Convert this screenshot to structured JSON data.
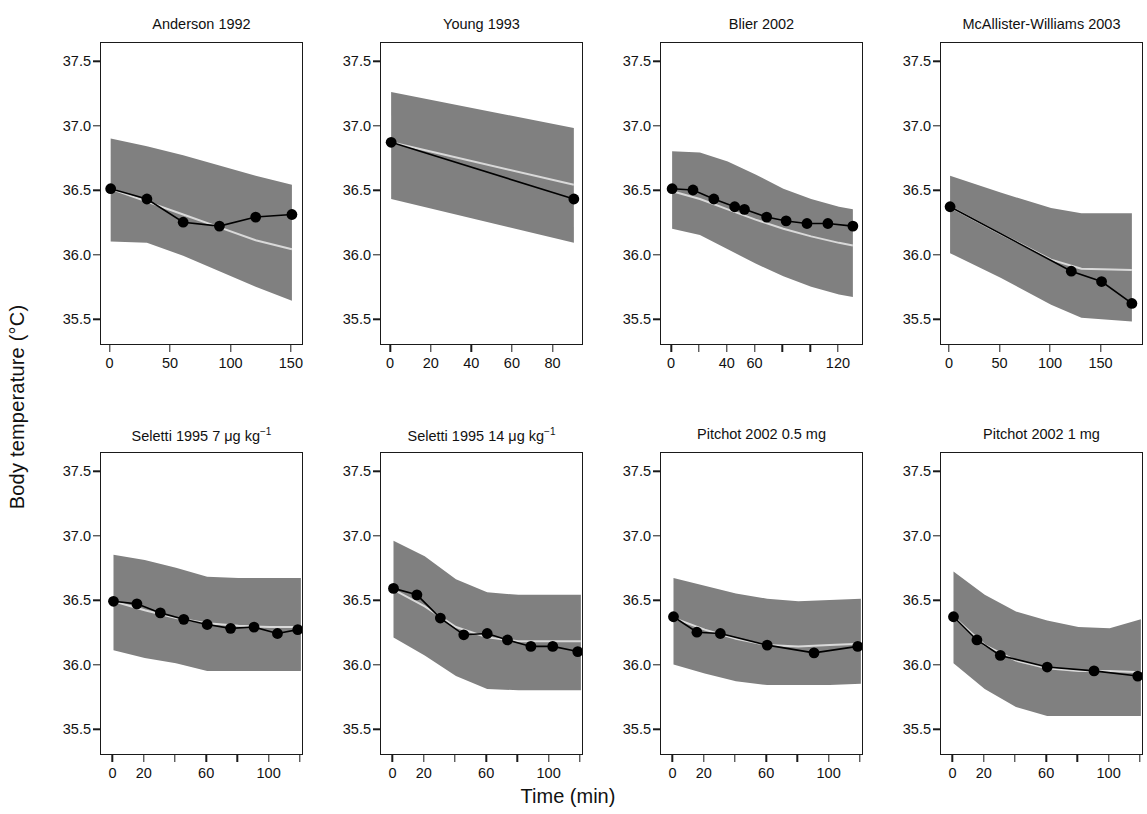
{
  "figure": {
    "ylabel": "Body temperature (°C)",
    "xlabel": "Time (min)",
    "band_color": "#808080",
    "mean_line_color": "#d9d9d9",
    "observed_color": "#000000"
  },
  "chart_data": {
    "type": "line",
    "title": "",
    "xlabel": "Time (min)",
    "ylabel": "Body temperature (°C)",
    "ylim": [
      35.3,
      37.65
    ],
    "yticks": [
      35.5,
      36.0,
      36.5,
      37.0,
      37.5
    ],
    "ytick_labels": [
      "35.5",
      "36.0",
      "36.5",
      "37.0",
      "37.5"
    ],
    "grid": false,
    "legend": "none",
    "layout": {
      "rows": 2,
      "cols": 4
    },
    "series_description": {
      "observed": "Observed mean body temperature (filled black circles joined by black line)",
      "band": "Grey shaded 95% prediction interval",
      "model": "Light grey model-predicted mean line"
    },
    "panels": [
      {
        "title": "Anderson 1992",
        "row": 0,
        "col": 0,
        "xlim": [
          -8,
          160
        ],
        "xticks": [
          0,
          50,
          100,
          150
        ],
        "xtick_labels": [
          "0",
          "50",
          "100",
          "150"
        ],
        "xtick_minor": [],
        "observed": {
          "x": [
            0,
            30,
            60,
            90,
            120,
            150
          ],
          "y": [
            36.52,
            36.44,
            36.26,
            36.23,
            36.3,
            36.32
          ]
        },
        "model_line": {
          "x": [
            0,
            30,
            60,
            90,
            120,
            150
          ],
          "y": [
            36.52,
            36.42,
            36.32,
            36.22,
            36.12,
            36.05
          ]
        },
        "band_upper": {
          "x": [
            0,
            30,
            60,
            90,
            120,
            150
          ],
          "y": [
            36.91,
            36.85,
            36.78,
            36.7,
            36.62,
            36.55
          ]
        },
        "band_lower": {
          "x": [
            0,
            30,
            60,
            90,
            120,
            150
          ],
          "y": [
            36.11,
            36.1,
            36.0,
            35.88,
            35.76,
            35.65
          ]
        }
      },
      {
        "title": "Young 1993",
        "row": 0,
        "col": 1,
        "xlim": [
          -5,
          95
        ],
        "xticks": [
          0,
          20,
          40,
          60,
          80
        ],
        "xtick_labels": [
          "0",
          "20",
          "40",
          "60",
          "80"
        ],
        "xtick_minor": [],
        "observed": {
          "x": [
            0,
            90
          ],
          "y": [
            36.88,
            36.44
          ]
        },
        "model_line": {
          "x": [
            0,
            90
          ],
          "y": [
            36.88,
            36.55
          ]
        },
        "band_upper": {
          "x": [
            0,
            90
          ],
          "y": [
            37.27,
            36.99
          ]
        },
        "band_lower": {
          "x": [
            0,
            90
          ],
          "y": [
            36.44,
            36.1
          ]
        }
      },
      {
        "title": "Blier 2002",
        "row": 0,
        "col": 2,
        "xlim": [
          -8,
          138
        ],
        "xticks": [
          0,
          40,
          60,
          120
        ],
        "xtick_labels": [
          "0",
          "40",
          "60",
          "120"
        ],
        "xtick_minor": [
          20,
          80,
          100
        ],
        "observed": {
          "x": [
            0,
            15,
            30,
            45,
            52,
            68,
            82,
            97,
            112,
            130
          ],
          "y": [
            36.52,
            36.51,
            36.44,
            36.38,
            36.36,
            36.3,
            36.27,
            36.25,
            36.25,
            36.23
          ]
        },
        "model_line": {
          "x": [
            0,
            20,
            40,
            60,
            80,
            100,
            120,
            130
          ],
          "y": [
            36.5,
            36.44,
            36.36,
            36.28,
            36.21,
            36.15,
            36.1,
            36.08
          ]
        },
        "band_upper": {
          "x": [
            0,
            20,
            40,
            60,
            80,
            100,
            120,
            130
          ],
          "y": [
            36.81,
            36.8,
            36.73,
            36.63,
            36.52,
            36.44,
            36.38,
            36.36
          ]
        },
        "band_lower": {
          "x": [
            0,
            20,
            40,
            60,
            80,
            100,
            120,
            130
          ],
          "y": [
            36.21,
            36.16,
            36.05,
            35.94,
            35.84,
            35.76,
            35.7,
            35.68
          ]
        }
      },
      {
        "title": "McAllister-Williams 2003",
        "row": 0,
        "col": 3,
        "xlim": [
          -9,
          192
        ],
        "xticks": [
          0,
          50,
          100,
          150
        ],
        "xtick_labels": [
          "0",
          "50",
          "100",
          "150"
        ],
        "xtick_minor": [],
        "observed": {
          "x": [
            0,
            120,
            150,
            180
          ],
          "y": [
            36.38,
            35.88,
            35.8,
            35.63
          ]
        },
        "model_line": {
          "x": [
            0,
            50,
            100,
            130,
            180
          ],
          "y": [
            36.38,
            36.17,
            35.97,
            35.9,
            35.89
          ]
        },
        "band_upper": {
          "x": [
            0,
            50,
            100,
            130,
            180
          ],
          "y": [
            36.62,
            36.49,
            36.37,
            36.33,
            36.33
          ]
        },
        "band_lower": {
          "x": [
            0,
            50,
            100,
            130,
            180
          ],
          "y": [
            36.02,
            35.83,
            35.62,
            35.52,
            35.49
          ]
        }
      },
      {
        "title": "Seletti 1995  7 μg kg",
        "title_sup": "−1",
        "row": 1,
        "col": 0,
        "xlim": [
          -8,
          122
        ],
        "xticks": [
          0,
          20,
          60,
          100
        ],
        "xtick_labels": [
          "0",
          "20",
          "60",
          "100"
        ],
        "xtick_minor": [
          40,
          80,
          120
        ],
        "observed": {
          "x": [
            0,
            15,
            30,
            45,
            60,
            75,
            90,
            105,
            118
          ],
          "y": [
            36.5,
            36.48,
            36.41,
            36.36,
            36.32,
            36.29,
            36.3,
            36.25,
            36.28
          ]
        },
        "model_line": {
          "x": [
            0,
            20,
            40,
            60,
            80,
            100,
            120
          ],
          "y": [
            36.5,
            36.43,
            36.37,
            36.33,
            36.31,
            36.3,
            36.3
          ]
        },
        "band_upper": {
          "x": [
            0,
            20,
            40,
            60,
            80,
            100,
            120
          ],
          "y": [
            36.86,
            36.82,
            36.76,
            36.69,
            36.68,
            36.68,
            36.68
          ]
        },
        "band_lower": {
          "x": [
            0,
            20,
            40,
            60,
            80,
            100,
            120
          ],
          "y": [
            36.12,
            36.06,
            36.02,
            35.96,
            35.96,
            35.96,
            35.96
          ]
        }
      },
      {
        "title": "Seletti 1995  14 μg kg",
        "title_sup": "−1",
        "row": 1,
        "col": 1,
        "xlim": [
          -8,
          122
        ],
        "xticks": [
          0,
          20,
          60,
          100
        ],
        "xtick_labels": [
          "0",
          "20",
          "60",
          "100"
        ],
        "xtick_minor": [
          40,
          80,
          120
        ],
        "observed": {
          "x": [
            0,
            15,
            30,
            45,
            60,
            73,
            88,
            102,
            118
          ],
          "y": [
            36.6,
            36.55,
            36.37,
            36.24,
            36.25,
            36.2,
            36.15,
            36.15,
            36.11
          ]
        },
        "model_line": {
          "x": [
            0,
            20,
            40,
            60,
            80,
            100,
            120
          ],
          "y": [
            36.59,
            36.46,
            36.3,
            36.22,
            36.19,
            36.19,
            36.19
          ]
        },
        "band_upper": {
          "x": [
            0,
            20,
            40,
            60,
            80,
            100,
            120
          ],
          "y": [
            36.97,
            36.85,
            36.67,
            36.57,
            36.55,
            36.55,
            36.55
          ]
        },
        "band_lower": {
          "x": [
            0,
            20,
            40,
            60,
            80,
            100,
            120
          ],
          "y": [
            36.22,
            36.08,
            35.92,
            35.82,
            35.81,
            35.81,
            35.81
          ]
        }
      },
      {
        "title": "Pitchot 2002  0.5 mg",
        "row": 1,
        "col": 2,
        "xlim": [
          -8,
          122
        ],
        "xticks": [
          0,
          20,
          60,
          100
        ],
        "xtick_labels": [
          "0",
          "20",
          "60",
          "100"
        ],
        "xtick_minor": [
          40,
          80,
          120
        ],
        "observed": {
          "x": [
            0,
            15,
            30,
            60,
            90,
            118
          ],
          "y": [
            36.38,
            36.26,
            36.25,
            36.16,
            36.1,
            36.15
          ]
        },
        "model_line": {
          "x": [
            0,
            20,
            40,
            60,
            80,
            100,
            120
          ],
          "y": [
            36.37,
            36.28,
            36.21,
            36.16,
            36.15,
            36.16,
            36.17
          ]
        },
        "band_upper": {
          "x": [
            0,
            20,
            40,
            60,
            80,
            100,
            120
          ],
          "y": [
            36.68,
            36.62,
            36.56,
            36.52,
            36.5,
            36.51,
            36.52
          ]
        },
        "band_lower": {
          "x": [
            0,
            20,
            40,
            60,
            80,
            100,
            120
          ],
          "y": [
            36.01,
            35.94,
            35.88,
            35.85,
            35.85,
            35.85,
            35.86
          ]
        }
      },
      {
        "title": "Pitchot 2002  1 mg",
        "row": 1,
        "col": 3,
        "xlim": [
          -8,
          122
        ],
        "xticks": [
          0,
          20,
          60,
          100
        ],
        "xtick_labels": [
          "0",
          "20",
          "60",
          "100"
        ],
        "xtick_minor": [
          40,
          80,
          120
        ],
        "observed": {
          "x": [
            0,
            15,
            30,
            60,
            90,
            118
          ],
          "y": [
            36.38,
            36.2,
            36.08,
            35.99,
            35.96,
            35.92
          ]
        },
        "model_line": {
          "x": [
            0,
            20,
            40,
            60,
            80,
            100,
            120
          ],
          "y": [
            36.38,
            36.16,
            36.04,
            35.98,
            35.96,
            35.96,
            35.95
          ]
        },
        "band_upper": {
          "x": [
            0,
            20,
            40,
            60,
            80,
            100,
            120
          ],
          "y": [
            36.73,
            36.55,
            36.42,
            36.35,
            36.3,
            36.29,
            36.36
          ]
        },
        "band_lower": {
          "x": [
            0,
            20,
            40,
            60,
            80,
            100,
            120
          ],
          "y": [
            36.02,
            35.82,
            35.68,
            35.61,
            35.61,
            35.61,
            35.61
          ]
        }
      }
    ]
  }
}
